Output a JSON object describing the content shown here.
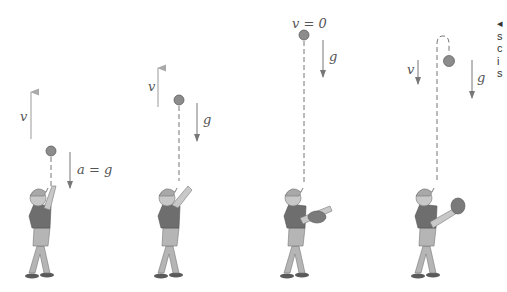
{
  "figure": {
    "panels": [
      {
        "id": "panel-1",
        "velocity_label": "v",
        "velocity_direction": "up",
        "acceleration_label": "a = g",
        "acceleration_direction": "down",
        "phase": "ball rising after throw"
      },
      {
        "id": "panel-2",
        "velocity_label": "v",
        "velocity_direction": "up",
        "acceleration_label": "g",
        "acceleration_direction": "down",
        "phase": "ball rising, slowing"
      },
      {
        "id": "panel-3",
        "velocity_label": "v = 0",
        "velocity_direction": "none",
        "acceleration_label": "g",
        "acceleration_direction": "down",
        "phase": "ball at top of path"
      },
      {
        "id": "panel-4",
        "velocity_label": "v",
        "velocity_direction": "down",
        "acceleration_label": "g",
        "acceleration_direction": "down",
        "phase": "ball falling back"
      }
    ],
    "caption_fragment": {
      "bullet": "◂",
      "lines": [
        "s",
        "c",
        "i",
        "s"
      ]
    },
    "colors": {
      "arrow": "#8a8a8a",
      "label": "#555555",
      "ball": "#8c8c8c",
      "shirt": "#6e6e6e",
      "pants": "#b5b5b5",
      "skin": "#c8c8c8",
      "cap": "#a8a8a8",
      "shoe": "#5a5a5a"
    }
  }
}
